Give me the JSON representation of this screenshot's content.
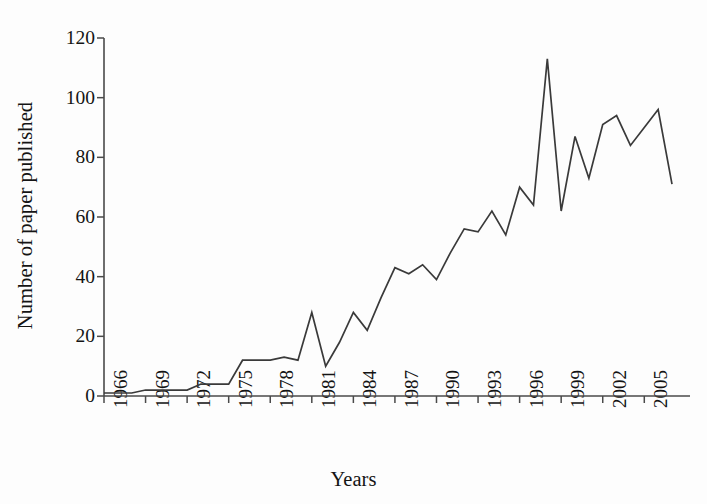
{
  "chart_data": {
    "type": "line",
    "title": "",
    "xlabel": "Years",
    "ylabel": "Number of paper published",
    "xlim": [
      1966,
      2007
    ],
    "ylim": [
      0,
      120
    ],
    "grid": false,
    "legend": null,
    "y_ticks": [
      0,
      20,
      40,
      60,
      80,
      100,
      120
    ],
    "y_tick_labels": [
      "0",
      "20",
      "40",
      "60",
      "80",
      "100",
      "120"
    ],
    "x_ticks": [
      1966,
      1969,
      1972,
      1975,
      1978,
      1981,
      1984,
      1987,
      1990,
      1993,
      1996,
      1999,
      2002,
      2005
    ],
    "x_tick_labels": [
      "1966",
      "1969",
      "1972",
      "1975",
      "1978",
      "1981",
      "1984",
      "1987",
      "1990",
      "1993",
      "1996",
      "1999",
      "2002",
      "2005"
    ],
    "x": [
      1966,
      1967,
      1968,
      1969,
      1970,
      1971,
      1972,
      1973,
      1974,
      1975,
      1976,
      1977,
      1978,
      1979,
      1980,
      1981,
      1982,
      1983,
      1984,
      1985,
      1986,
      1987,
      1988,
      1989,
      1990,
      1991,
      1992,
      1993,
      1994,
      1995,
      1996,
      1997,
      1998,
      1999,
      2000,
      2001,
      2002,
      2003,
      2004,
      2005,
      2006,
      2007
    ],
    "values": [
      1,
      1,
      1,
      2,
      2,
      2,
      2,
      4,
      4,
      4,
      12,
      12,
      12,
      13,
      12,
      28,
      10,
      18,
      28,
      22,
      33,
      43,
      41,
      44,
      39,
      48,
      56,
      55,
      62,
      54,
      70,
      64,
      113,
      62,
      87,
      73,
      91,
      94,
      84,
      90,
      96,
      71
    ],
    "line_color": "#3a3a3a",
    "background_color": "#fdfdfd",
    "series": [
      {
        "name": "Number of paper published",
        "values": [
          1,
          1,
          1,
          2,
          2,
          2,
          2,
          4,
          4,
          4,
          12,
          12,
          12,
          13,
          12,
          28,
          10,
          18,
          28,
          22,
          33,
          43,
          41,
          44,
          39,
          48,
          56,
          55,
          62,
          54,
          70,
          64,
          113,
          62,
          87,
          73,
          91,
          94,
          84,
          90,
          96,
          71
        ]
      }
    ]
  }
}
